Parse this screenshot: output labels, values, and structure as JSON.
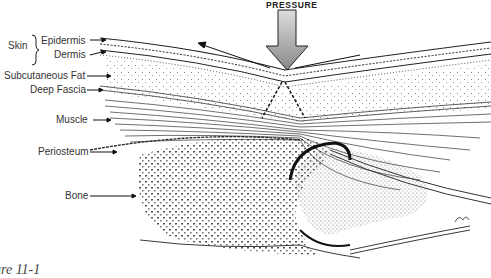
{
  "figure": {
    "title": "PRESSURE",
    "caption": "ure 11-1",
    "labels": {
      "skin": "Skin",
      "epidermis": "Epidermis",
      "dermis": "Dermis",
      "subcutaneous_fat": "Subcutaneous Fat",
      "deep_fascia": "Deep Fascia",
      "muscle": "Muscle",
      "periosteum": "Periosteum",
      "bone": "Bone"
    }
  },
  "colors": {
    "ink": "#222222",
    "background": "#ffffff",
    "label": "#333333"
  }
}
